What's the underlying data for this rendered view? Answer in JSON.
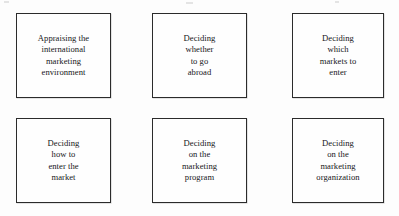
{
  "diagram": {
    "type": "flow-boxes",
    "rows": 2,
    "columns": 3,
    "border_color": "#2b2b2b",
    "background_color": "#fdfdfd",
    "text_color": "#17171a",
    "nodes": [
      {
        "id": "node-1",
        "row": 1,
        "column": 1,
        "label": "Appraising the\ninternational\nmarketing\nenvironment"
      },
      {
        "id": "node-2",
        "row": 1,
        "column": 2,
        "label": "Deciding\nwhether\nto go\nabroad"
      },
      {
        "id": "node-3",
        "row": 1,
        "column": 3,
        "label": "Deciding\nwhich\nmarkets to\nenter"
      },
      {
        "id": "node-4",
        "row": 2,
        "column": 1,
        "label": "Deciding\nhow to\nenter the\nmarket"
      },
      {
        "id": "node-5",
        "row": 2,
        "column": 2,
        "label": "Deciding\non the\nmarketing\nprogram"
      },
      {
        "id": "node-6",
        "row": 2,
        "column": 3,
        "label": "Deciding\non the\nmarketing\norganization"
      }
    ]
  }
}
